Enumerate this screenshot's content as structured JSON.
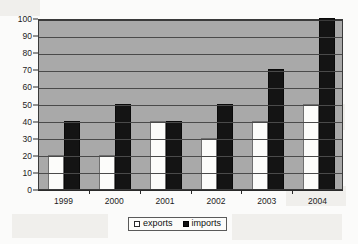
{
  "chart_data": {
    "type": "bar",
    "title": "",
    "subtitle": "",
    "xlabel": "",
    "ylabel": "",
    "categories": [
      "1999",
      "2000",
      "2001",
      "2002",
      "2003",
      "2004"
    ],
    "series": [
      {
        "name": "exports",
        "color": "#ffffff",
        "values": [
          20,
          20,
          40,
          30,
          40,
          50
        ]
      },
      {
        "name": "imports",
        "color": "#111111",
        "values": [
          40,
          50,
          40,
          50,
          70,
          100
        ]
      }
    ],
    "ylim": [
      0,
      100
    ],
    "ytick_step": 10,
    "yticks": [
      "100",
      "90",
      "80",
      "70",
      "60",
      "50",
      "40",
      "30",
      "20",
      "10",
      "0"
    ],
    "grid": true,
    "grid_orientation": "horizontal",
    "legend_position": "bottom",
    "plot_background_color": "#a9a9a9",
    "annotations": []
  },
  "legend": {
    "entries": [
      {
        "label": "exports",
        "swatch": "white-square-swatch"
      },
      {
        "label": "imports",
        "swatch": "black-square-swatch"
      }
    ]
  }
}
